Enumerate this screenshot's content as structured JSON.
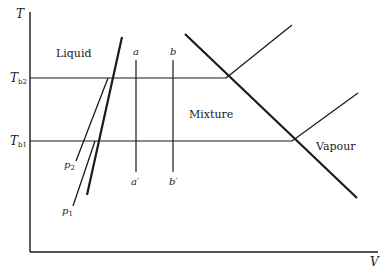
{
  "diagram": {
    "axes": {
      "y_label": "T",
      "x_label": "V"
    },
    "temperature_levels": [
      {
        "id": "Tb2",
        "label": "T",
        "subscript": "b2"
      },
      {
        "id": "Tb1",
        "label": "T",
        "subscript": "b1"
      }
    ],
    "regions": {
      "liquid": "Liquid",
      "mixture": "Mixture",
      "vapour": "Vapour"
    },
    "isobars": {
      "p1": {
        "label": "p",
        "subscript": "1"
      },
      "p2": {
        "label": "p",
        "subscript": "2"
      }
    },
    "paths": {
      "a": "a",
      "a_prime": "a′",
      "b": "b",
      "b_prime": "b′"
    },
    "line_color": "#1a1a1a"
  }
}
